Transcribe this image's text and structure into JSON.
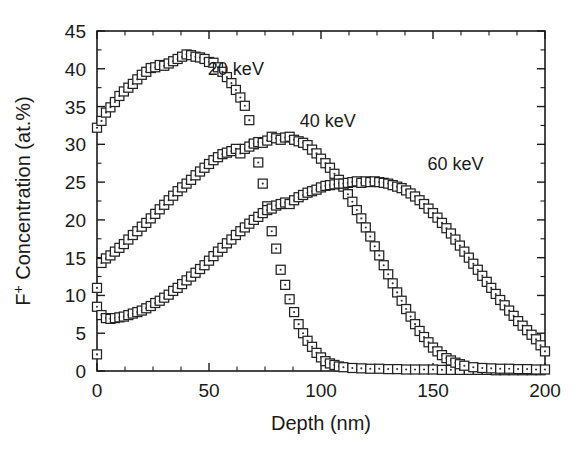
{
  "chart_data": {
    "type": "scatter",
    "title": "",
    "xlabel": "Depth (nm)",
    "ylabel": "F+ Concentration (at.%)",
    "ylabel_parts": {
      "base": "F",
      "sup": "+",
      "rest": " Concentration (at.%)"
    },
    "xlim": [
      0,
      200
    ],
    "ylim": [
      0,
      45
    ],
    "xticks": [
      0,
      50,
      100,
      150,
      200
    ],
    "yticks": [
      0,
      5,
      10,
      15,
      20,
      25,
      30,
      35,
      40,
      45
    ],
    "xtick_labels": [
      "0",
      "50",
      "100",
      "150",
      "200"
    ],
    "ytick_labels": [
      "0",
      "5",
      "10",
      "15",
      "20",
      "25",
      "30",
      "35",
      "40",
      "45"
    ],
    "x_minor_step": 12.5,
    "y_minor_step": 2.5,
    "grid": false,
    "legend_position": "inline-annotations",
    "marker": "open-square-with-center-dot",
    "marker_size_px": 9,
    "annotations": [
      {
        "text": "20 keV",
        "x": 62,
        "y": 39.2
      },
      {
        "text": "40 keV",
        "x": 103,
        "y": 32.3
      },
      {
        "text": "60 keV",
        "x": 160,
        "y": 26.6
      }
    ],
    "series": [
      {
        "name": "20 keV",
        "label": "20 keV",
        "x": [
          0,
          2,
          4,
          6,
          8,
          10,
          12,
          14,
          16,
          18,
          20,
          22,
          24,
          26,
          28,
          30,
          32,
          34,
          36,
          38,
          40,
          42,
          44,
          46,
          48,
          50,
          52,
          54,
          56,
          58,
          60,
          62,
          64,
          66,
          68,
          70,
          72,
          74,
          76,
          78,
          80,
          82,
          84,
          86,
          88,
          90,
          92,
          94,
          96,
          98,
          100,
          102,
          104,
          106,
          108,
          110,
          114,
          118,
          122,
          126,
          130,
          134,
          138,
          142,
          146,
          150,
          154,
          158,
          162,
          166,
          170,
          174,
          178,
          182,
          186,
          190,
          194,
          198
        ],
        "y": [
          32.2,
          33.1,
          34.2,
          34.9,
          35.6,
          36.4,
          37.0,
          37.5,
          38.0,
          38.6,
          39.2,
          39.6,
          40.1,
          40.2,
          40.5,
          40.4,
          40.7,
          41.0,
          41.3,
          41.6,
          41.9,
          41.8,
          41.6,
          41.5,
          41.3,
          40.9,
          40.8,
          40.2,
          39.6,
          38.9,
          38.1,
          37.2,
          36.2,
          35.1,
          33.2,
          30.0,
          27.6,
          24.8,
          21.8,
          18.5,
          16.2,
          13.4,
          11.4,
          9.5,
          7.8,
          6.2,
          5.0,
          4.0,
          3.2,
          2.4,
          1.8,
          1.3,
          1.0,
          0.8,
          0.6,
          0.5,
          0.4,
          0.35,
          0.3,
          0.3,
          0.25,
          0.25,
          0.2,
          0.2,
          0.2,
          0.2,
          0.15,
          0.15,
          0.15,
          0.15,
          0.15,
          0.15,
          0.1,
          0.1,
          0.1,
          0.1,
          0.1,
          0.1
        ]
      },
      {
        "name": "40 keV",
        "label": "40 keV",
        "x": [
          0,
          2,
          4,
          6,
          8,
          10,
          12,
          14,
          16,
          18,
          20,
          22,
          24,
          26,
          28,
          30,
          32,
          34,
          36,
          38,
          40,
          42,
          44,
          46,
          48,
          50,
          52,
          54,
          56,
          58,
          60,
          62,
          64,
          66,
          68,
          70,
          72,
          74,
          76,
          78,
          80,
          82,
          84,
          86,
          88,
          90,
          92,
          94,
          96,
          98,
          100,
          102,
          104,
          106,
          108,
          110,
          112,
          114,
          116,
          118,
          120,
          122,
          124,
          126,
          128,
          130,
          132,
          134,
          136,
          138,
          140,
          142,
          144,
          146,
          148,
          150,
          152,
          154,
          156,
          158,
          160,
          162,
          164,
          168,
          172,
          176,
          180,
          184,
          188,
          192,
          196,
          200
        ],
        "y": [
          11.0,
          14.3,
          14.9,
          15.3,
          15.8,
          16.3,
          16.8,
          17.4,
          18.0,
          18.5,
          19.1,
          19.6,
          20.2,
          20.8,
          21.4,
          22.0,
          22.6,
          23.2,
          23.8,
          24.3,
          24.8,
          25.3,
          25.9,
          26.4,
          26.9,
          27.4,
          27.9,
          28.3,
          28.7,
          28.9,
          29.1,
          29.4,
          28.8,
          29.4,
          29.7,
          30.1,
          30.3,
          30.2,
          30.5,
          31.0,
          30.8,
          30.6,
          30.9,
          31.0,
          30.6,
          30.4,
          30.2,
          29.9,
          29.3,
          28.8,
          28.1,
          27.5,
          26.9,
          26.1,
          25.3,
          24.4,
          23.4,
          22.4,
          21.3,
          20.2,
          19.0,
          17.8,
          16.5,
          15.3,
          14.0,
          12.8,
          11.6,
          10.4,
          9.3,
          8.2,
          7.2,
          6.2,
          5.3,
          4.5,
          3.8,
          3.1,
          2.6,
          2.1,
          1.7,
          1.4,
          1.1,
          0.9,
          0.7,
          0.5,
          0.4,
          0.35,
          0.3,
          0.3,
          0.25,
          0.25,
          0.2,
          0.2
        ]
      },
      {
        "name": "60 keV",
        "label": "60 keV",
        "x": [
          0,
          2,
          4,
          6,
          8,
          10,
          12,
          14,
          16,
          18,
          20,
          22,
          24,
          26,
          28,
          30,
          32,
          34,
          36,
          38,
          40,
          42,
          44,
          46,
          48,
          50,
          52,
          54,
          56,
          58,
          60,
          62,
          64,
          66,
          68,
          70,
          72,
          74,
          76,
          78,
          80,
          82,
          84,
          86,
          88,
          90,
          92,
          94,
          96,
          98,
          100,
          102,
          104,
          106,
          108,
          110,
          112,
          114,
          116,
          118,
          120,
          122,
          124,
          126,
          128,
          130,
          132,
          134,
          136,
          138,
          140,
          142,
          144,
          146,
          148,
          150,
          152,
          154,
          156,
          158,
          160,
          162,
          164,
          166,
          168,
          170,
          172,
          174,
          176,
          178,
          180,
          182,
          184,
          186,
          188,
          190,
          192,
          194,
          196,
          198,
          200
        ],
        "y": [
          8.5,
          7.4,
          7.0,
          6.9,
          7.0,
          7.1,
          7.2,
          7.4,
          7.6,
          7.8,
          8.0,
          8.3,
          8.6,
          9.0,
          9.3,
          9.7,
          10.1,
          10.6,
          11.0,
          11.5,
          12.0,
          12.5,
          13.0,
          13.5,
          14.0,
          14.6,
          15.2,
          15.8,
          16.3,
          16.9,
          17.4,
          18.0,
          18.5,
          19.0,
          19.5,
          20.0,
          20.4,
          20.9,
          21.3,
          21.5,
          21.9,
          22.1,
          22.3,
          22.1,
          22.6,
          23.0,
          23.3,
          23.6,
          23.8,
          24.0,
          24.3,
          24.5,
          24.6,
          24.7,
          24.8,
          24.8,
          24.9,
          25.0,
          25.1,
          24.9,
          25.1,
          25.0,
          25.1,
          25.0,
          24.9,
          24.8,
          24.6,
          24.4,
          24.2,
          23.9,
          23.5,
          23.1,
          22.6,
          22.1,
          21.5,
          20.9,
          20.3,
          19.6,
          18.9,
          18.2,
          17.4,
          16.6,
          15.8,
          15.0,
          14.2,
          13.4,
          12.6,
          11.8,
          11.0,
          10.2,
          9.4,
          8.7,
          8.0,
          7.3,
          6.6,
          6.0,
          5.4,
          4.8,
          4.2,
          3.4,
          2.6
        ]
      },
      {
        "name": "surface-outlier",
        "label": "",
        "x": [
          0
        ],
        "y": [
          2.2
        ]
      }
    ]
  },
  "plot_geometry": {
    "left": 97,
    "right": 545,
    "top": 31,
    "bottom": 371
  }
}
